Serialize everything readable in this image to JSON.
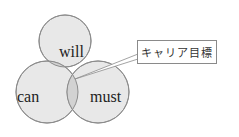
{
  "diagram": {
    "type": "venn",
    "circles": [
      {
        "label": "will"
      },
      {
        "label": "can"
      },
      {
        "label": "must"
      }
    ],
    "callout": {
      "label": "キャリア目標",
      "points_to": "intersection of will, can, must"
    },
    "colors": {
      "circle_fill": "#e6e6e6",
      "circle_stroke": "#8c8c8c",
      "overlap_fill": "#cfcfcf"
    }
  }
}
